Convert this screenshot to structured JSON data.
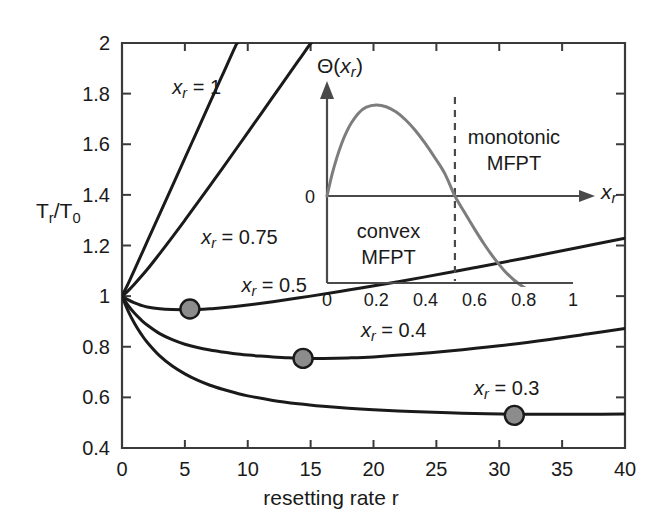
{
  "chart_data": {
    "type": "line",
    "title": "",
    "xlabel": "resetting rate r",
    "ylabel": "T_r/T_0",
    "ylabel_parts": {
      "main1": "T",
      "sub1": "r",
      "slash": "/",
      "main2": "T",
      "sub2": "0"
    },
    "xlim": [
      0,
      40
    ],
    "ylim": [
      0.4,
      2
    ],
    "xticks": [
      "0",
      "5",
      "10",
      "15",
      "20",
      "25",
      "30",
      "35",
      "40"
    ],
    "xtick_values": [
      0,
      5,
      10,
      15,
      20,
      25,
      30,
      35,
      40
    ],
    "yticks": [
      "0.4",
      "0.6",
      "0.8",
      "1",
      "1.2",
      "1.4",
      "1.6",
      "1.8",
      "2"
    ],
    "ytick_values": [
      0.4,
      0.6,
      0.8,
      1.0,
      1.2,
      1.4,
      1.6,
      1.8,
      2.0
    ],
    "grid": false,
    "legend": "inline-labels",
    "series": [
      {
        "name": "xr = 1",
        "label_prefix": "x",
        "label_sub": "r",
        "label_suffix": " = 1",
        "label_x": 4.0,
        "label_y": 1.8,
        "marker": null,
        "points": [
          [
            0,
            1.0
          ],
          [
            0.5,
            1.05
          ],
          [
            1,
            1.105
          ],
          [
            2,
            1.215
          ],
          [
            3,
            1.325
          ],
          [
            4,
            1.435
          ],
          [
            5,
            1.545
          ],
          [
            6,
            1.655
          ],
          [
            7,
            1.765
          ],
          [
            8,
            1.875
          ],
          [
            9,
            1.985
          ],
          [
            9.2,
            2.0
          ]
        ]
      },
      {
        "name": "xr = 0.75",
        "label_prefix": "x",
        "label_sub": "r",
        "label_suffix": " = 0.75",
        "label_x": 6.3,
        "label_y": 1.205,
        "marker": null,
        "points": [
          [
            0,
            1.0
          ],
          [
            0.5,
            1.022
          ],
          [
            1,
            1.048
          ],
          [
            2,
            1.105
          ],
          [
            3,
            1.168
          ],
          [
            4,
            1.233
          ],
          [
            5,
            1.3
          ],
          [
            6,
            1.368
          ],
          [
            7,
            1.437
          ],
          [
            8,
            1.506
          ],
          [
            10,
            1.646
          ],
          [
            12,
            1.787
          ],
          [
            14,
            1.928
          ],
          [
            15,
            1.999
          ],
          [
            15.05,
            2.0
          ]
        ]
      },
      {
        "name": "xr = 0.5",
        "label_prefix": "x",
        "label_sub": "r",
        "label_suffix": " = 0.5",
        "label_x": 9.5,
        "label_y": 1.018,
        "marker": {
          "x": 5.4,
          "y": 0.949
        },
        "points": [
          [
            0,
            1.0
          ],
          [
            0.5,
            0.985
          ],
          [
            1,
            0.973
          ],
          [
            1.5,
            0.964
          ],
          [
            2,
            0.957
          ],
          [
            3,
            0.95
          ],
          [
            4,
            0.947
          ],
          [
            5,
            0.9465
          ],
          [
            5.4,
            0.9465
          ],
          [
            6,
            0.947
          ],
          [
            7,
            0.95
          ],
          [
            8,
            0.954
          ],
          [
            10,
            0.965
          ],
          [
            12,
            0.978
          ],
          [
            15,
            1.0
          ],
          [
            18,
            1.024
          ],
          [
            21,
            1.049
          ],
          [
            24,
            1.075
          ],
          [
            28,
            1.112
          ],
          [
            32,
            1.15
          ],
          [
            36,
            1.189
          ],
          [
            40,
            1.229
          ]
        ]
      },
      {
        "name": "xr = 0.4",
        "label_prefix": "x",
        "label_sub": "r",
        "label_suffix": " = 0.4",
        "label_x": 19.0,
        "label_y": 0.838,
        "marker": {
          "x": 14.4,
          "y": 0.754
        },
        "points": [
          [
            0,
            1.0
          ],
          [
            0.5,
            0.962
          ],
          [
            1,
            0.932
          ],
          [
            1.5,
            0.907
          ],
          [
            2,
            0.886
          ],
          [
            3,
            0.852
          ],
          [
            4,
            0.828
          ],
          [
            5,
            0.81
          ],
          [
            6,
            0.797
          ],
          [
            7,
            0.787
          ],
          [
            8,
            0.779
          ],
          [
            9,
            0.772
          ],
          [
            10,
            0.767
          ],
          [
            11,
            0.763
          ],
          [
            12,
            0.76
          ],
          [
            13,
            0.757
          ],
          [
            14.4,
            0.754
          ],
          [
            16,
            0.754
          ],
          [
            18,
            0.756
          ],
          [
            20,
            0.76
          ],
          [
            23,
            0.77
          ],
          [
            26,
            0.783
          ],
          [
            30,
            0.804
          ],
          [
            34,
            0.829
          ],
          [
            37,
            0.85
          ],
          [
            40,
            0.872
          ]
        ]
      },
      {
        "name": "xr = 0.3",
        "label_prefix": "x",
        "label_sub": "r",
        "label_suffix": " = 0.3",
        "label_x": 28.0,
        "label_y": 0.608,
        "marker": {
          "x": 31.2,
          "y": 0.529
        },
        "points": [
          [
            0,
            1.0
          ],
          [
            0.5,
            0.94
          ],
          [
            1,
            0.892
          ],
          [
            1.5,
            0.852
          ],
          [
            2,
            0.818
          ],
          [
            3,
            0.764
          ],
          [
            4,
            0.724
          ],
          [
            5,
            0.693
          ],
          [
            6,
            0.668
          ],
          [
            7,
            0.648
          ],
          [
            8,
            0.632
          ],
          [
            9,
            0.618
          ],
          [
            10,
            0.606
          ],
          [
            12,
            0.588
          ],
          [
            14,
            0.575
          ],
          [
            16,
            0.565
          ],
          [
            18,
            0.557
          ],
          [
            20,
            0.551
          ],
          [
            23,
            0.544
          ],
          [
            26,
            0.539
          ],
          [
            29,
            0.535
          ],
          [
            31.2,
            0.5335
          ],
          [
            34,
            0.533
          ],
          [
            37,
            0.533
          ],
          [
            40,
            0.534
          ]
        ]
      }
    ],
    "inset": {
      "type": "line",
      "ylabel_prefix": "Θ(",
      "ylabel_var": "x",
      "ylabel_sub": "r",
      "ylabel_suffix": ")",
      "xlabel_var": "x",
      "xlabel_sub": "r",
      "zero_label": "0",
      "xticks": [
        "0",
        "0.2",
        "0.4",
        "0.6",
        "0.8",
        "1"
      ],
      "xtick_values": [
        0,
        0.2,
        0.4,
        0.6,
        0.8,
        1.0
      ],
      "xlim": [
        0,
        1
      ],
      "ylim": [
        -1.0,
        1.0
      ],
      "crossing_x": 0.52,
      "dashed_line_x": 0.52,
      "regions": [
        {
          "name": "convex-mfpt",
          "line1": "convex",
          "line2": "MFPT",
          "x": 0.25,
          "side": "left"
        },
        {
          "name": "monotonic-mfpt",
          "line1": "monotonic",
          "line2": "MFPT",
          "x": 0.76,
          "side": "right"
        }
      ],
      "points": [
        [
          0.0,
          0.0
        ],
        [
          0.02,
          0.22
        ],
        [
          0.04,
          0.4
        ],
        [
          0.06,
          0.55
        ],
        [
          0.08,
          0.67
        ],
        [
          0.1,
          0.765
        ],
        [
          0.13,
          0.868
        ],
        [
          0.16,
          0.925
        ],
        [
          0.2,
          0.947
        ],
        [
          0.24,
          0.93
        ],
        [
          0.28,
          0.877
        ],
        [
          0.32,
          0.792
        ],
        [
          0.36,
          0.68
        ],
        [
          0.4,
          0.545
        ],
        [
          0.44,
          0.393
        ],
        [
          0.48,
          0.228
        ],
        [
          0.52,
          0.0
        ],
        [
          0.56,
          -0.175
        ],
        [
          0.6,
          -0.345
        ],
        [
          0.64,
          -0.505
        ],
        [
          0.68,
          -0.65
        ],
        [
          0.72,
          -0.775
        ],
        [
          0.76,
          -0.875
        ],
        [
          0.8,
          -0.95
        ],
        [
          0.84,
          -1.005
        ],
        [
          0.88,
          -1.042
        ],
        [
          0.92,
          -1.062
        ],
        [
          0.96,
          -1.072
        ],
        [
          1.0,
          -1.075
        ]
      ]
    }
  },
  "colors": {
    "curve": "#1a1a1a",
    "inset_curve": "#7d7d7d",
    "marker_fill": "#8c8c8c",
    "marker_stroke": "#1a1a1a",
    "axis": "#3a3a3a",
    "inset_axis": "#4a4a4a",
    "dashed": "#4a4a4a",
    "background": "#ffffff"
  }
}
